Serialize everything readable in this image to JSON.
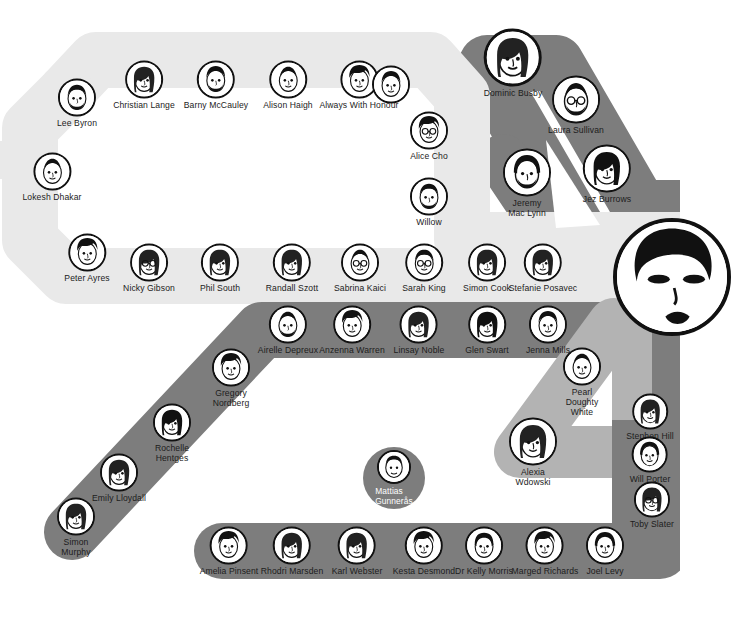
{
  "diagram": {
    "type": "metro-map",
    "colors": {
      "light_line": "#e9e9e9",
      "mid_line": "#b3b3b3",
      "dark_line": "#7d7d7d",
      "background": "#ffffff",
      "text": "#1c1c1c",
      "bubble_stroke": "#111111"
    },
    "lines": [
      {
        "name": "light-loop-line",
        "color": "#e9e9e9",
        "stations": 16
      },
      {
        "name": "dark-diagonal-line",
        "color": "#7d7d7d",
        "stations": 11
      },
      {
        "name": "dark-top-right-branch",
        "color": "#7d7d7d",
        "stations": 5
      },
      {
        "name": "mid-right-branch",
        "color": "#b3b3b3",
        "stations": 5
      },
      {
        "name": "dark-bottom-line",
        "color": "#7d7d7d",
        "stations": 8
      }
    ]
  },
  "stations": {
    "light_top": [
      {
        "name": "Lee Byron",
        "x": 77,
        "y": 103,
        "r": 17,
        "lx": 0,
        "ly": 0
      },
      {
        "name": "Christian Lange",
        "x": 144,
        "y": 85,
        "r": 17,
        "lx": 0,
        "ly": 0
      },
      {
        "name": "Barny McCauley",
        "x": 216,
        "y": 85,
        "r": 17,
        "lx": 0,
        "ly": 0
      },
      {
        "name": "Alison Haigh",
        "x": 288,
        "y": 85,
        "r": 17,
        "lx": 0,
        "ly": 0
      },
      {
        "name": "Always With Honour",
        "x": 359,
        "y": 85,
        "r": 17,
        "lx": 0,
        "ly": 0
      },
      {
        "name": "",
        "x": 391,
        "y": 85,
        "r": 17,
        "lx": 0,
        "ly": 0
      }
    ],
    "light_left": [
      {
        "name": "Lokesh Dhakar",
        "x": 52,
        "y": 177,
        "r": 17
      },
      {
        "name": "Peter Ayres",
        "x": 87,
        "y": 258,
        "r": 17
      }
    ],
    "light_right": [
      {
        "name": "Alice Cho",
        "x": 429,
        "y": 136,
        "r": 17
      },
      {
        "name": "Willow",
        "x": 429,
        "y": 202,
        "r": 17
      }
    ],
    "light_bottom": [
      {
        "name": "Nicky Gibson",
        "x": 149,
        "y": 268,
        "r": 17
      },
      {
        "name": "Phil South",
        "x": 220,
        "y": 268,
        "r": 17
      },
      {
        "name": "Randall Szott",
        "x": 292,
        "y": 268,
        "r": 17
      },
      {
        "name": "Sabrina Kaici",
        "x": 360,
        "y": 268,
        "r": 17
      },
      {
        "name": "Sarah King",
        "x": 424,
        "y": 268,
        "r": 17
      },
      {
        "name": "Simon Cook",
        "x": 487,
        "y": 268,
        "r": 17
      },
      {
        "name": "Stefanie Posavec",
        "x": 543,
        "y": 268,
        "r": 17
      }
    ],
    "dark_middle": [
      {
        "name": "Airelle Depreux",
        "x": 288,
        "y": 330,
        "r": 17
      },
      {
        "name": "Anzenna Warren",
        "x": 352,
        "y": 330,
        "r": 17
      },
      {
        "name": "Linsay Noble",
        "x": 419,
        "y": 330,
        "r": 17
      },
      {
        "name": "Glen Swart",
        "x": 487,
        "y": 330,
        "r": 17
      },
      {
        "name": "Jenna Mills",
        "x": 548,
        "y": 330,
        "r": 17
      }
    ],
    "dark_southwest": [
      {
        "name": "Gregory\nNordberg",
        "x": 231,
        "y": 378,
        "r": 17
      },
      {
        "name": "Rochelle\nHentges",
        "x": 172,
        "y": 433,
        "r": 17
      },
      {
        "name": "Emily Lloydall",
        "x": 119,
        "y": 478,
        "r": 17
      },
      {
        "name": "Simon\nMurphy",
        "x": 76,
        "y": 527,
        "r": 17
      }
    ],
    "dark_topright": [
      {
        "name": "Dominic Busby",
        "x": 513,
        "y": 63,
        "r": 26
      },
      {
        "name": "Laura Sullivan",
        "x": 576,
        "y": 105,
        "r": 22
      },
      {
        "name": "Jez Burrows",
        "x": 607,
        "y": 174,
        "r": 22
      },
      {
        "name": "Jeremy\nMac Lynn",
        "x": 527,
        "y": 183,
        "r": 22
      }
    ],
    "mid_right": [
      {
        "name": "Pearl\nDoughty\nWhite",
        "x": 582,
        "y": 382,
        "r": 17
      },
      {
        "name": "Alexia\nWdowski",
        "x": 533,
        "y": 452,
        "r": 22
      }
    ],
    "right_edge": [
      {
        "name": "Stephen Hill",
        "x": 650,
        "y": 417,
        "r": 16
      },
      {
        "name": "Will Porter",
        "x": 650,
        "y": 460,
        "r": 16
      },
      {
        "name": "Toby Slater",
        "x": 652,
        "y": 505,
        "r": 16
      }
    ],
    "dark_bottom": [
      {
        "name": "Amelia Pinsent",
        "x": 229,
        "y": 551,
        "r": 17
      },
      {
        "name": "Rhodri Marsden",
        "x": 292,
        "y": 551,
        "r": 17
      },
      {
        "name": "Karl Webster",
        "x": 357,
        "y": 551,
        "r": 17
      },
      {
        "name": "Kesta Desmond",
        "x": 424,
        "y": 551,
        "r": 17
      },
      {
        "name": "Dr Kelly Morris",
        "x": 484,
        "y": 551,
        "r": 17
      },
      {
        "name": "Marged Richards",
        "x": 545,
        "y": 551,
        "r": 17
      },
      {
        "name": "Joel Levy",
        "x": 605,
        "y": 551,
        "r": 17
      }
    ],
    "isolated": [
      {
        "name": "Mattias\nGunnerås",
        "x": 394,
        "y": 478,
        "r": 17
      }
    ],
    "hub": {
      "name": "main-portrait",
      "x": 672,
      "y": 277,
      "r": 55
    }
  }
}
